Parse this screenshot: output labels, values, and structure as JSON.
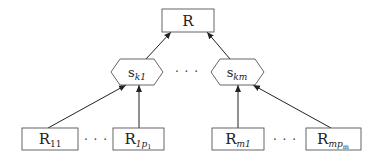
{
  "diagram": {
    "type": "tree",
    "root": {
      "id": "R",
      "label": "R",
      "shape": "rectangle"
    },
    "middle": [
      {
        "id": "s_k1",
        "base": "s",
        "sub": "k1",
        "shape": "hexagon"
      },
      {
        "id": "s_km",
        "base": "s",
        "sub": "km",
        "shape": "hexagon"
      }
    ],
    "middle_ellipsis": "· · ·",
    "leaves": [
      {
        "id": "R_11",
        "base": "R",
        "sub": "11",
        "sub_italic": false,
        "shape": "rectangle",
        "parent": "s_k1"
      },
      {
        "id": "R_1p1",
        "base": "R",
        "sub": "1p",
        "subsub": "1",
        "shape": "rectangle",
        "parent": "s_k1"
      },
      {
        "id": "R_m1",
        "base": "R",
        "sub": "m1",
        "shape": "rectangle",
        "parent": "s_km"
      },
      {
        "id": "R_mpm",
        "base": "R",
        "sub": "mp",
        "subsub": "m",
        "shape": "rectangle",
        "parent": "s_km"
      }
    ],
    "leaf_ellipses": [
      "· · ·",
      "· · ·"
    ],
    "edges": [
      {
        "from": "R_11",
        "to": "s_k1"
      },
      {
        "from": "R_1p1",
        "to": "s_k1"
      },
      {
        "from": "R_m1",
        "to": "s_km"
      },
      {
        "from": "R_mpm",
        "to": "s_km"
      },
      {
        "from": "s_k1",
        "to": "R"
      },
      {
        "from": "s_km",
        "to": "R"
      }
    ],
    "colors": {
      "stroke": "#222222",
      "box_border": "#555555",
      "background": "#ffffff"
    }
  }
}
